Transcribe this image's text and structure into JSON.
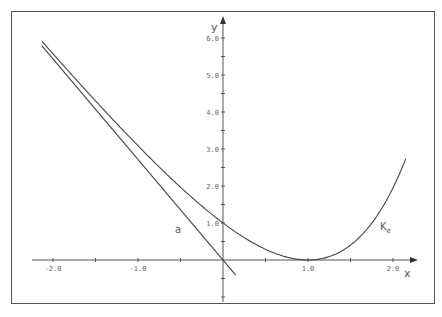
{
  "chart_data": {
    "type": "line",
    "title": "",
    "xlabel": "x",
    "ylabel": "y",
    "xlim": [
      -2.15,
      2.3
    ],
    "ylim": [
      -0.5,
      6.3
    ],
    "x_ticks": [
      -2.0,
      -1.5,
      -1.0,
      -0.5,
      0.5,
      1.0,
      1.5,
      2.0
    ],
    "x_tick_labels": [
      "-2.0",
      "-1.0",
      "1.0",
      "2.0"
    ],
    "y_ticks": [
      -1.0,
      -0.5,
      0.5,
      1.0,
      1.5,
      2.0,
      2.5,
      3.0,
      3.5,
      4.0,
      4.5,
      5.0,
      5.5,
      6.0
    ],
    "y_tick_labels": [
      "1.0",
      "2.0",
      "3.0",
      "4.0",
      "5.0",
      "6.0"
    ],
    "grid": false,
    "legend": "none (inline labels)",
    "series": [
      {
        "name": "K_e",
        "label_main": "K",
        "label_sub": "e",
        "formula": "y = e^x - e*x",
        "x": [
          -2.13,
          -2.0,
          -1.5,
          -1.0,
          -0.5,
          0.0,
          0.5,
          1.0,
          1.5,
          2.0,
          2.15
        ],
        "values": [
          5.91,
          5.57,
          4.3,
          3.09,
          1.97,
          1.0,
          0.29,
          0.0,
          0.4,
          1.95,
          2.74
        ]
      },
      {
        "name": "a",
        "label_main": "a",
        "formula": "y = -e*x",
        "x": [
          -2.13,
          0.0,
          0.15
        ],
        "values": [
          5.79,
          0.0,
          -0.41
        ]
      }
    ]
  },
  "axes": {
    "x_name": "x",
    "y_name": "y"
  }
}
